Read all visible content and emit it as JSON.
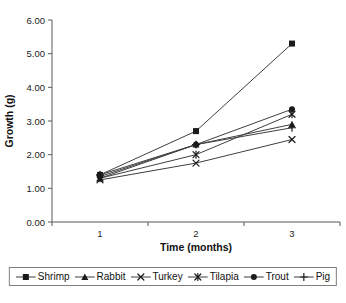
{
  "chart_data": {
    "type": "line",
    "x": [
      1,
      2,
      3
    ],
    "xtick_labels": [
      "1",
      "2",
      "3"
    ],
    "xlabel": "Time (months)",
    "ylabel": "Growth (g)",
    "ylim": [
      0,
      6
    ],
    "ytick_step": 1,
    "ytick_labels": [
      "0.00",
      "1.00",
      "2.00",
      "3.00",
      "4.00",
      "5.00",
      "6.00"
    ],
    "grid": false,
    "legend_position": "bottom",
    "line_color": "#3f3f3f",
    "marker_color": "#1a1a1a",
    "axis_color": "#595959",
    "series": [
      {
        "name": "Shrimp",
        "marker": "square",
        "values": [
          1.4,
          2.7,
          5.3
        ]
      },
      {
        "name": "Rabbit",
        "marker": "triangle",
        "values": [
          1.3,
          2.3,
          2.9
        ]
      },
      {
        "name": "Turkey",
        "marker": "x",
        "values": [
          1.25,
          1.75,
          2.45
        ]
      },
      {
        "name": "Tilapia",
        "marker": "asterisk",
        "values": [
          1.3,
          2.0,
          3.2
        ]
      },
      {
        "name": "Trout",
        "marker": "circle",
        "values": [
          1.35,
          2.3,
          3.35
        ]
      },
      {
        "name": "Pig",
        "marker": "plus",
        "values": [
          1.4,
          2.3,
          2.8
        ]
      }
    ]
  }
}
